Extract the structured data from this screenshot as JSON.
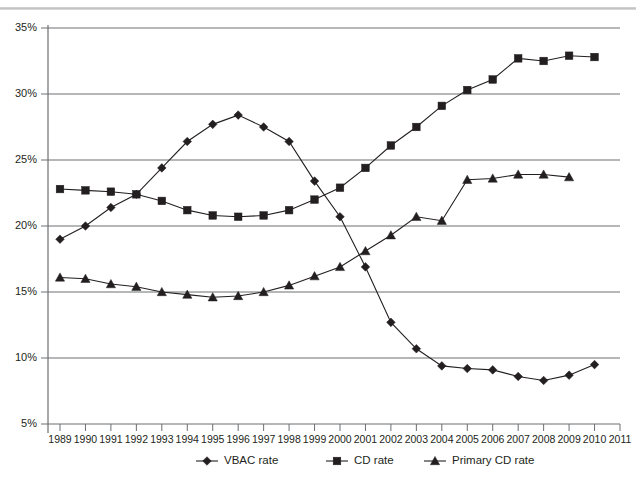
{
  "chart_data": {
    "type": "line",
    "title": "",
    "subtitle": "",
    "xlabel": "",
    "ylabel": "",
    "grid": true,
    "legend_position": "bottom",
    "xlim": [
      1988.5,
      2011
    ],
    "ylim": [
      5,
      35
    ],
    "ytick_labels": [
      "5%",
      "10%",
      "15%",
      "20%",
      "25%",
      "30%",
      "35%"
    ],
    "ytick_values": [
      5,
      10,
      15,
      20,
      25,
      30,
      35
    ],
    "xtick_labels": [
      "1989",
      "1990",
      "1991",
      "1992",
      "1993",
      "1994",
      "1995",
      "1996",
      "1997",
      "1998",
      "1999",
      "2000",
      "2001",
      "2002",
      "2003",
      "2004",
      "2005",
      "2006",
      "2007",
      "2008",
      "2009",
      "2010",
      "2011"
    ],
    "x": [
      1989,
      1990,
      1991,
      1992,
      1993,
      1994,
      1995,
      1996,
      1997,
      1998,
      1999,
      2000,
      2001,
      2002,
      2003,
      2004,
      2005,
      2006,
      2007,
      2008,
      2009,
      2010
    ],
    "series": [
      {
        "name": "VBAC rate",
        "marker": "diamond",
        "values": [
          19.0,
          20.0,
          21.4,
          22.4,
          24.4,
          26.4,
          27.7,
          28.4,
          27.5,
          26.4,
          23.4,
          20.7,
          16.9,
          12.7,
          10.7,
          9.4,
          9.2,
          9.1,
          8.6,
          8.3,
          8.7,
          9.5
        ]
      },
      {
        "name": "CD rate",
        "marker": "square",
        "values": [
          22.8,
          22.7,
          22.6,
          22.4,
          21.9,
          21.2,
          20.8,
          20.7,
          20.8,
          21.2,
          22.0,
          22.9,
          24.4,
          26.1,
          27.5,
          29.1,
          30.3,
          31.1,
          32.7,
          32.5,
          32.9,
          32.8
        ]
      },
      {
        "name": "Primary CD rate",
        "marker": "triangle",
        "values": [
          16.1,
          16.0,
          15.6,
          15.4,
          15.0,
          14.8,
          14.6,
          14.7,
          15.0,
          15.5,
          16.2,
          16.9,
          18.1,
          19.3,
          20.7,
          20.4,
          23.5,
          23.6,
          23.9,
          23.9,
          23.7,
          null
        ]
      }
    ]
  },
  "legend": {
    "items": [
      {
        "label": "VBAC rate",
        "marker": "diamond"
      },
      {
        "label": "CD rate",
        "marker": "square"
      },
      {
        "label": "Primary CD rate",
        "marker": "triangle"
      }
    ]
  }
}
